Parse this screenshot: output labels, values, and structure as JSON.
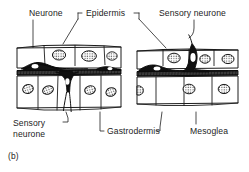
{
  "figure": {
    "panel_caption": "(b)",
    "labels": {
      "neurone_top": "Neurone",
      "epidermis": "Epidermis",
      "sensory_neurone_top": "Sensory neurone",
      "sensory_neurone_bottom": "Sensory\nneurone",
      "gastrodermis": "Gastrodermis",
      "mesoglea": "Mesoglea"
    },
    "colors": {
      "ink": "#1a1a1a",
      "background": "#ffffff",
      "cell_fill": "#ffffff",
      "neuron_fill": "#111111",
      "mesoglea_fill": "#2b2b2b"
    },
    "panels": [
      {
        "name": "left-panel",
        "structure": "epidermis over mesoglea over gastrodermis",
        "epidermis_cells": 3,
        "gastrodermis_cells": 4,
        "neurons": [
          "epidermal nerve-net neurone on mesoglea",
          "sensory neurone spanning mesoglea into gastrodermis"
        ]
      },
      {
        "name": "right-panel",
        "structure": "epidermis over mesoglea over gastrodermis",
        "epidermis_cells": 4,
        "gastrodermis_cells": 4,
        "neurons": [
          "epidermal neurone on mesoglea",
          "sensory neurone with apical process reaching the epidermal surface"
        ]
      }
    ]
  }
}
